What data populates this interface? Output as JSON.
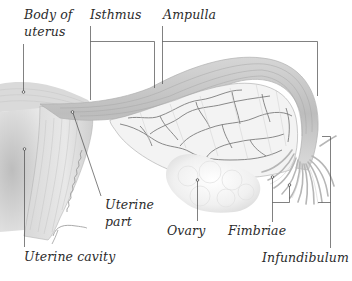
{
  "diagram": {
    "type": "anatomical-illustration",
    "labels": {
      "body_of_uterus": [
        "Body of",
        "uterus"
      ],
      "isthmus": "Isthmus",
      "ampulla": "Ampulla",
      "uterine_part": [
        "Uterine",
        "part"
      ],
      "ovary": "Ovary",
      "fimbriae": "Fimbriae",
      "uterine_cavity": "Uterine cavity",
      "infundibulum": "Infundibulum"
    },
    "colors": {
      "background": "#ffffff",
      "tissue_light": "#e6e6e6",
      "tissue_mid": "#c9c9c9",
      "tissue_dark": "#9a9a9a",
      "vessel": "#7a7a7a",
      "leader_line": "#4a4a4a",
      "label_text": "#2b2b2b"
    }
  }
}
